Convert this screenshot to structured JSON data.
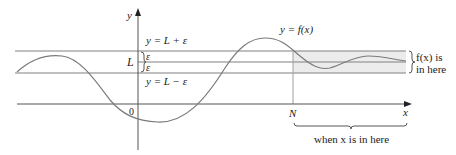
{
  "diagram": {
    "labels": {
      "y_axis": "y",
      "x_axis": "x",
      "origin": "0",
      "L": "L",
      "upper_line": "y = L + ε",
      "lower_line": "y = L − ε",
      "epsilon_top": "ε",
      "epsilon_bottom": "ε",
      "curve": "y = f(x)",
      "N": "N",
      "fx_in_here_1": "f(x) is",
      "fx_in_here_2": "in here",
      "when_x_in_here": "when x is in here"
    },
    "colors": {
      "lines": "#808080",
      "curve": "#7a7a7a",
      "shade": "#ececec",
      "axis": "#555555",
      "text": "#222222"
    }
  }
}
